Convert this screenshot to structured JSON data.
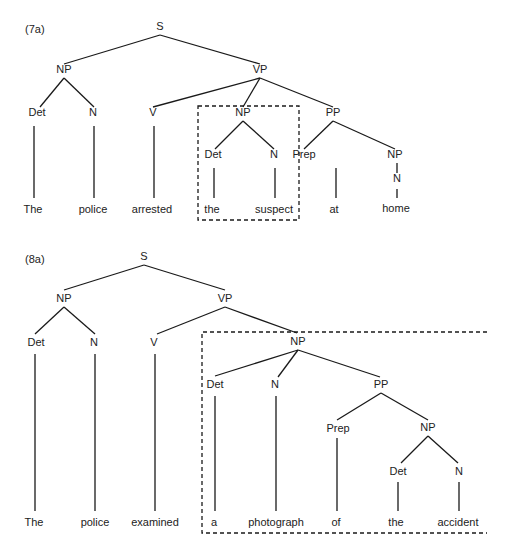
{
  "diagrams": [
    {
      "id": "7a",
      "label": "(7a)",
      "nodes": [
        {
          "id": "S",
          "text": "S",
          "x": 160,
          "y": 30
        },
        {
          "id": "NP1",
          "text": "NP",
          "x": 64,
          "y": 73
        },
        {
          "id": "VP",
          "text": "VP",
          "x": 260,
          "y": 73
        },
        {
          "id": "Det1",
          "text": "Det",
          "x": 37,
          "y": 116
        },
        {
          "id": "N1",
          "text": "N",
          "x": 93,
          "y": 116
        },
        {
          "id": "V",
          "text": "V",
          "x": 153,
          "y": 116
        },
        {
          "id": "NP2",
          "text": "NP",
          "x": 243,
          "y": 116
        },
        {
          "id": "PP",
          "text": "PP",
          "x": 333,
          "y": 116
        },
        {
          "id": "Det2",
          "text": "Det",
          "x": 213,
          "y": 158
        },
        {
          "id": "N2",
          "text": "N",
          "x": 274,
          "y": 158
        },
        {
          "id": "Prep",
          "text": "Prep",
          "x": 304,
          "y": 158
        },
        {
          "id": "NP3",
          "text": "NP",
          "x": 395,
          "y": 158
        },
        {
          "id": "N3",
          "text": "N",
          "x": 397,
          "y": 182
        },
        {
          "id": "w1",
          "text": "The",
          "x": 33,
          "y": 213
        },
        {
          "id": "w2",
          "text": "police",
          "x": 93,
          "y": 213
        },
        {
          "id": "w3",
          "text": "arrested",
          "x": 152,
          "y": 213
        },
        {
          "id": "w4",
          "text": "the",
          "x": 212,
          "y": 213
        },
        {
          "id": "w5",
          "text": "suspect",
          "x": 274,
          "y": 213
        },
        {
          "id": "w6",
          "text": "at",
          "x": 334,
          "y": 213
        },
        {
          "id": "w7",
          "text": "home",
          "x": 396,
          "y": 212
        }
      ],
      "edges": [
        [
          160,
          35,
          64,
          64
        ],
        [
          160,
          35,
          260,
          64
        ],
        [
          64,
          78,
          40,
          107
        ],
        [
          64,
          78,
          94,
          107
        ],
        [
          260,
          78,
          153,
          107
        ],
        [
          260,
          78,
          243,
          107
        ],
        [
          260,
          78,
          333,
          107
        ],
        [
          243,
          121,
          215,
          149
        ],
        [
          243,
          121,
          274,
          149
        ],
        [
          333,
          121,
          304,
          149
        ],
        [
          333,
          121,
          395,
          149
        ],
        [
          34,
          126,
          34,
          198
        ],
        [
          94,
          126,
          94,
          198
        ],
        [
          154,
          126,
          154,
          198
        ],
        [
          214,
          168,
          214,
          198
        ],
        [
          275,
          168,
          275,
          198
        ],
        [
          336,
          168,
          336,
          198
        ],
        [
          397,
          163,
          397,
          173
        ],
        [
          397,
          189,
          397,
          198
        ]
      ],
      "box": {
        "x": 198,
        "y": 106,
        "w": 101,
        "h": 114,
        "open_right": false
      }
    },
    {
      "id": "8a",
      "label": "(8a)",
      "nodes": [
        {
          "id": "S",
          "text": "S",
          "x": 144,
          "y": 260
        },
        {
          "id": "NP1",
          "text": "NP",
          "x": 64,
          "y": 302
        },
        {
          "id": "VP",
          "text": "VP",
          "x": 225,
          "y": 302
        },
        {
          "id": "Det1",
          "text": "Det",
          "x": 36,
          "y": 346
        },
        {
          "id": "N1",
          "text": "N",
          "x": 94,
          "y": 346
        },
        {
          "id": "V",
          "text": "V",
          "x": 154,
          "y": 346
        },
        {
          "id": "NP2",
          "text": "NP",
          "x": 298,
          "y": 345
        },
        {
          "id": "Det2",
          "text": "Det",
          "x": 215,
          "y": 388
        },
        {
          "id": "N2",
          "text": "N",
          "x": 275,
          "y": 388
        },
        {
          "id": "PP",
          "text": "PP",
          "x": 381,
          "y": 388
        },
        {
          "id": "Prep",
          "text": "Prep",
          "x": 338,
          "y": 432
        },
        {
          "id": "NP3",
          "text": "NP",
          "x": 428,
          "y": 431
        },
        {
          "id": "Det3",
          "text": "Det",
          "x": 398,
          "y": 475
        },
        {
          "id": "N3",
          "text": "N",
          "x": 459,
          "y": 475
        },
        {
          "id": "w1",
          "text": "The",
          "x": 34,
          "y": 526
        },
        {
          "id": "w2",
          "text": "police",
          "x": 95,
          "y": 526
        },
        {
          "id": "w3",
          "text": "examined",
          "x": 155,
          "y": 526
        },
        {
          "id": "w4",
          "text": "a",
          "x": 214,
          "y": 526
        },
        {
          "id": "w5",
          "text": "photograph",
          "x": 276,
          "y": 526
        },
        {
          "id": "w6",
          "text": "of",
          "x": 336,
          "y": 526
        },
        {
          "id": "w7",
          "text": "the",
          "x": 396,
          "y": 526
        },
        {
          "id": "w8",
          "text": "accident",
          "x": 458,
          "y": 526
        }
      ],
      "edges": [
        [
          144,
          265,
          64,
          290
        ],
        [
          144,
          265,
          225,
          290
        ],
        [
          64,
          307,
          35,
          334
        ],
        [
          64,
          307,
          95,
          334
        ],
        [
          225,
          307,
          157,
          334
        ],
        [
          225,
          307,
          297,
          333
        ],
        [
          298,
          350,
          215,
          376
        ],
        [
          298,
          350,
          278,
          377
        ],
        [
          298,
          350,
          380,
          377
        ],
        [
          381,
          393,
          337,
          420
        ],
        [
          381,
          393,
          428,
          420
        ],
        [
          428,
          436,
          401,
          463
        ],
        [
          428,
          436,
          458,
          463
        ],
        [
          35,
          354,
          35,
          511
        ],
        [
          95,
          354,
          95,
          511
        ],
        [
          155,
          354,
          155,
          511
        ],
        [
          215,
          396,
          215,
          511
        ],
        [
          276,
          396,
          276,
          511
        ],
        [
          337,
          438,
          337,
          511
        ],
        [
          398,
          482,
          398,
          511
        ],
        [
          459,
          482,
          459,
          511
        ]
      ],
      "box": {
        "x": 202,
        "y": 332,
        "w": 285,
        "h": 201,
        "open_right": true
      }
    }
  ]
}
